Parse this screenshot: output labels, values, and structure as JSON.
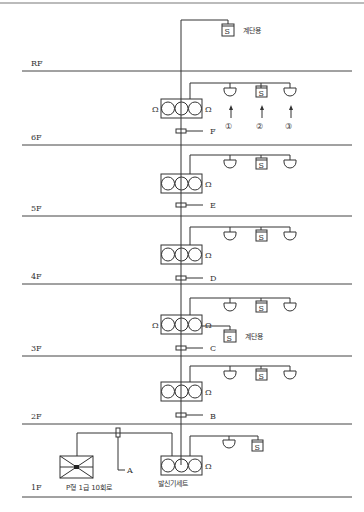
{
  "diagram": {
    "type": "building fire alarm riser diagram",
    "floors": [
      {
        "label": "RF",
        "y": 71
      },
      {
        "label": "6F",
        "y": 145
      },
      {
        "label": "5F",
        "y": 216
      },
      {
        "label": "4F",
        "y": 284
      },
      {
        "label": "3F",
        "y": 356
      },
      {
        "label": "2F",
        "y": 424
      },
      {
        "label": "1F",
        "y": 497
      }
    ],
    "section_markers": [
      {
        "label": "F",
        "y": 131
      },
      {
        "label": "E",
        "y": 205
      },
      {
        "label": "D",
        "y": 278
      },
      {
        "label": "C",
        "y": 348
      },
      {
        "label": "B",
        "y": 414
      },
      {
        "label": "A",
        "y": 470
      }
    ],
    "stair_label": "계단용",
    "device_numbers": [
      "①",
      "②",
      "③"
    ],
    "omega": "Ω",
    "smoke_symbol": "S",
    "receiver_label": "P형 1급 10회로",
    "transmitter_label": "발신기세트"
  }
}
